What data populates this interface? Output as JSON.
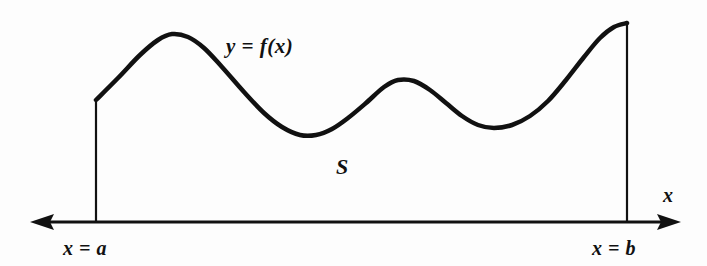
{
  "figure": {
    "background_color": "#fdfdfd",
    "ink_color": "#111111",
    "labels": {
      "curve": "y = f(x)",
      "region": "S",
      "x_axis": "x",
      "left_bound": "x = a",
      "right_bound": "x = b"
    },
    "icons": {
      "axis_arrow_left": "arrow-left-icon",
      "axis_arrow_right": "arrow-right-icon"
    }
  },
  "chart_data": {
    "type": "line",
    "xlabel": "x",
    "ylabel": "",
    "annotations": [
      "y = f(x)",
      "S",
      "x = a",
      "x = b"
    ],
    "axis": {
      "baseline_y_px": 222,
      "left_arrow_tip_px": 30,
      "right_arrow_tip_px": 681,
      "double_headed": true,
      "grid": false,
      "legend": null
    },
    "bounds": {
      "a_x_px": 96,
      "b_x_px": 627,
      "a_curve_top_y_px": 100,
      "b_curve_top_y_px": 23
    },
    "curve_points_px": [
      [
        96,
        100
      ],
      [
        118,
        78
      ],
      [
        140,
        55
      ],
      [
        158,
        40
      ],
      [
        172,
        34
      ],
      [
        188,
        37
      ],
      [
        204,
        48
      ],
      [
        222,
        67
      ],
      [
        244,
        92
      ],
      [
        264,
        113
      ],
      [
        282,
        127
      ],
      [
        300,
        135
      ],
      [
        316,
        135
      ],
      [
        332,
        129
      ],
      [
        348,
        118
      ],
      [
        366,
        103
      ],
      [
        384,
        87
      ],
      [
        398,
        80
      ],
      [
        414,
        81
      ],
      [
        430,
        90
      ],
      [
        446,
        103
      ],
      [
        462,
        116
      ],
      [
        478,
        125
      ],
      [
        494,
        128
      ],
      [
        512,
        125
      ],
      [
        530,
        116
      ],
      [
        548,
        101
      ],
      [
        566,
        80
      ],
      [
        584,
        57
      ],
      [
        600,
        38
      ],
      [
        614,
        27
      ],
      [
        627,
        23
      ]
    ],
    "features": {
      "peak_1": {
        "x_px": 172,
        "y_px": 34
      },
      "valley_1": {
        "x_px": 308,
        "y_px": 135
      },
      "peak_2": {
        "x_px": 398,
        "y_px": 80
      },
      "valley_2": {
        "x_px": 492,
        "y_px": 128
      },
      "right_endpoint": {
        "x_px": 627,
        "y_px": 23
      }
    },
    "stroke_widths_px": {
      "curve": 4.5,
      "axis": 3,
      "vertical_bounds": 2.2
    }
  }
}
